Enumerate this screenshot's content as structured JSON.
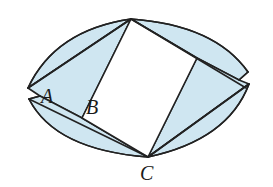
{
  "figure": {
    "colors": {
      "shade": "#cfe6f1",
      "stroke": "#222222",
      "background": "#ffffff"
    },
    "labels": {
      "A": "A",
      "B": "B",
      "C": "C"
    },
    "points": {
      "T": [
        131,
        19
      ],
      "R": [
        197,
        58
      ],
      "C": [
        148,
        157
      ],
      "B": [
        82,
        118
      ]
    }
  }
}
